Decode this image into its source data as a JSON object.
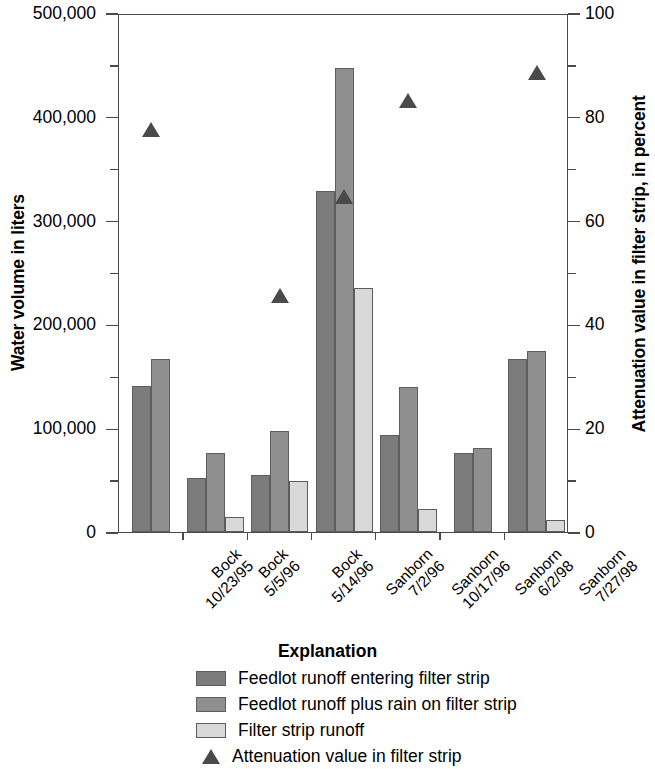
{
  "chart_data": {
    "type": "bar",
    "title": "",
    "xlabel": "",
    "ylabel": "Water volume in liters",
    "ylabel_right": "Attenuation value in filter strip, in percent",
    "ylim": [
      0,
      500000
    ],
    "ylim_right": [
      0,
      100
    ],
    "grid": false,
    "legend_position": "below",
    "ytick_labels": [
      "0",
      "100,000",
      "200,000",
      "300,000",
      "400,000",
      "500,000"
    ],
    "ytick_values": [
      0,
      100000,
      200000,
      300000,
      400000,
      500000
    ],
    "ytick_minor_values": [
      50000,
      150000,
      250000,
      350000,
      450000
    ],
    "ytick_right_labels": [
      "0",
      "20",
      "40",
      "60",
      "80",
      "100"
    ],
    "ytick_right_values": [
      0,
      20,
      40,
      60,
      80,
      100
    ],
    "ytick_right_minor_values": [
      10,
      30,
      50,
      70,
      90
    ],
    "categories": [
      "Bock\n10/23/95",
      "Bock\n5/5/96",
      "Bock\n5/14/96",
      "Sanborn\n7/2/96",
      "Sanborn\n10/17/96",
      "Sanborn\n6/2/98",
      "Sanborn\n7/27/98"
    ],
    "category_lines": [
      [
        "Bock",
        "10/23/95"
      ],
      [
        "Bock",
        "5/5/96"
      ],
      [
        "Bock",
        "5/14/96"
      ],
      [
        "Sanborn",
        "7/2/96"
      ],
      [
        "Sanborn",
        "10/17/96"
      ],
      [
        "Sanborn",
        "6/2/98"
      ],
      [
        "Sanborn",
        "7/27/98"
      ]
    ],
    "series": [
      {
        "name": "Feedlot runoff entering filter strip",
        "color": "#7c7c7c",
        "axis": "left",
        "values": [
          141000,
          52000,
          55000,
          329000,
          93000,
          76000,
          167000
        ]
      },
      {
        "name": "Feedlot runoff plus rain on filter strip",
        "color": "#8f8f8f",
        "axis": "left",
        "values": [
          167000,
          76000,
          97000,
          447000,
          140000,
          81000,
          174000
        ]
      },
      {
        "name": "Filter strip runoff",
        "color": "#d9d9d9",
        "axis": "left",
        "values": [
          null,
          14000,
          49000,
          235000,
          22000,
          null,
          12000
        ]
      },
      {
        "name": "Attenuation value in filter strip",
        "color": "#4a4a4a",
        "axis": "right",
        "marker": "triangle",
        "values": [
          78,
          null,
          46,
          65,
          83.5,
          null,
          89
        ]
      }
    ]
  },
  "legend": {
    "title": "Explanation",
    "entries": [
      {
        "label": "Feedlot runoff entering filter strip",
        "swatch": "s0"
      },
      {
        "label": "Feedlot runoff plus rain on filter strip",
        "swatch": "s1"
      },
      {
        "label": "Filter strip runoff",
        "swatch": "s2"
      },
      {
        "label": "Attenuation value in filter strip",
        "swatch": "triangle"
      }
    ]
  }
}
